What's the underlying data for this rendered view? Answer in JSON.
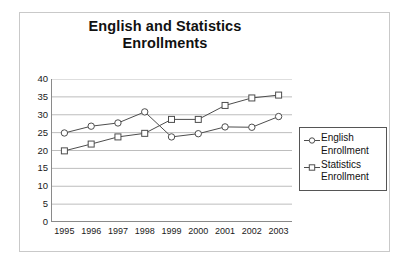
{
  "chart_data": {
    "type": "line",
    "title": "English and Statistics Enrollments",
    "title_lines": [
      "English and Statistics",
      "Enrollments"
    ],
    "xlabel": "",
    "ylabel": "",
    "categories": [
      "1995",
      "1996",
      "1997",
      "1998",
      "1999",
      "2000",
      "2001",
      "2002",
      "2003"
    ],
    "x": [
      1995,
      1996,
      1997,
      1998,
      1999,
      2000,
      2001,
      2002,
      2003
    ],
    "series": [
      {
        "name": "English Enrollment",
        "marker": "circle",
        "values": [
          24.9,
          26.8,
          27.7,
          30.8,
          23.8,
          24.7,
          26.6,
          26.5,
          29.5
        ]
      },
      {
        "name": "Statistics Enrollment",
        "marker": "square",
        "values": [
          19.9,
          21.8,
          23.8,
          24.8,
          28.7,
          28.7,
          32.6,
          34.7,
          35.5
        ]
      }
    ],
    "ylim": [
      0,
      40
    ],
    "ytick_labels": [
      "0",
      "5",
      "10",
      "15",
      "20",
      "25",
      "30",
      "35",
      "40"
    ],
    "yticks": [
      0,
      5,
      10,
      15,
      20,
      25,
      30,
      35,
      40
    ],
    "grid": "horizontal",
    "legend_position": "right",
    "colors": {
      "line": "#4d4d4d",
      "marker_fill": "#ffffff",
      "grid": "#b5b5b5",
      "axis": "#8a8a8a",
      "text": "#111111",
      "frame": "#c9c9c9",
      "legend_border": "#555555",
      "background": "#ffffff"
    }
  },
  "legend": {
    "entries": [
      {
        "label": "English\nEnrollment",
        "marker": "circle"
      },
      {
        "label": "Statistics\nEnrollment",
        "marker": "square"
      }
    ]
  }
}
